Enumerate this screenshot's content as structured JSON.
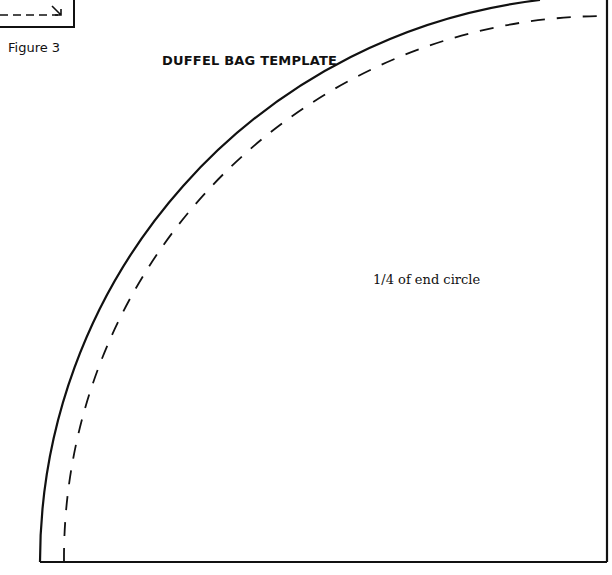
{
  "figure": {
    "label": "Figure 3",
    "title": "DUFFEL BAG TEMPLATE",
    "piece_label": "1/4 of end circle"
  },
  "colors": {
    "line": "#111111",
    "background": "#ffffff"
  }
}
